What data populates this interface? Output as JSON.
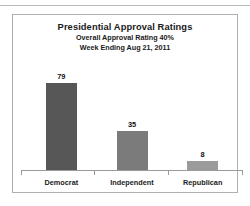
{
  "chart_data": {
    "type": "bar",
    "title": "Presidential Approval Ratings",
    "subtitle_1": "Overall Approval Rating 40%",
    "subtitle_2": "Week Ending Aug 21, 2011",
    "categories": [
      "Democrat",
      "Independent",
      "Republican"
    ],
    "values": [
      79,
      35,
      8
    ],
    "value_labels": [
      "79",
      "35",
      "8"
    ],
    "bar_colors": [
      "#575757",
      "#7b7b7b",
      "#9b9b9b"
    ],
    "xlabel": "",
    "ylabel": "",
    "ylim": [
      0,
      100
    ],
    "grid": false,
    "legend": "none",
    "axis_color": "#9a9a9a",
    "frame_color": "#b0b0b0",
    "text_color": "#1a1a1a"
  }
}
